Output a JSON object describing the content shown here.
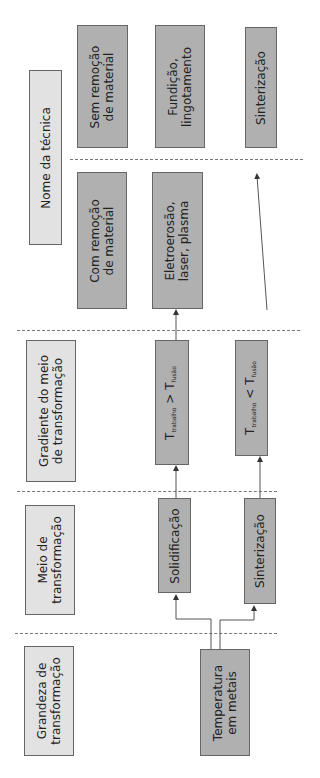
{
  "columns": {
    "technique_name": {
      "header": "Nome da técnica",
      "boxes": [
        {
          "line1": "Sem remoção",
          "line2": "de material"
        },
        {
          "line1": "Fundição,",
          "line2": "lingotamento"
        },
        {
          "line1": "Sinterização",
          "line2": ""
        },
        {
          "line1": "Com remoção",
          "line2": "de material"
        },
        {
          "line1": "Eletroerosão,",
          "line2": "laser, plasma"
        }
      ]
    },
    "gradient": {
      "header_line1": "Gradiente do meio",
      "header_line2": "de transformação",
      "boxes": [
        {
          "T": "T",
          "sub1": "trabalho",
          "op": ">",
          "T2": "T",
          "sub2": "fusão"
        },
        {
          "T": "T",
          "sub1": "trabalho",
          "op": "<",
          "T2": "T",
          "sub2": "fusão"
        }
      ]
    },
    "medium": {
      "header_line1": "Meio de",
      "header_line2": "transformação",
      "boxes": [
        {
          "label": "Solidificação"
        },
        {
          "label": "Sinterização"
        }
      ]
    },
    "magnitude": {
      "header_line1": "Grandeza de",
      "header_line2": "transformação",
      "boxes": [
        {
          "line1": "Temperatura",
          "line2": "em metais"
        }
      ]
    }
  },
  "colors": {
    "box_dark": "#b0b0b0",
    "box_light": "#e2e2e2",
    "line": "#555555"
  }
}
